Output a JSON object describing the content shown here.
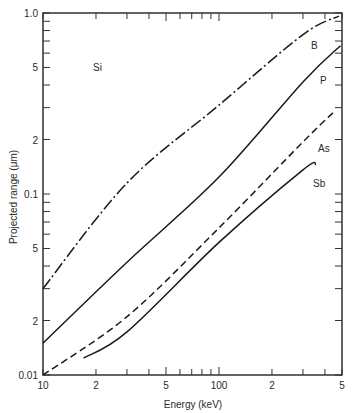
{
  "chart_data": {
    "type": "line",
    "title": "",
    "xlabel": "Energy (keV)",
    "ylabel": "Projected range (μm)",
    "xscale": "log",
    "yscale": "log",
    "xlim": [
      10,
      500
    ],
    "ylim": [
      0.01,
      1.0
    ],
    "grid": false,
    "legend": "inline labels",
    "x_tick_labels": [
      {
        "value": 10,
        "label": "10"
      },
      {
        "value": 20,
        "label": "2"
      },
      {
        "value": 50,
        "label": "5"
      },
      {
        "value": 100,
        "label": "100"
      },
      {
        "value": 200,
        "label": "2"
      },
      {
        "value": 500,
        "label": "5"
      }
    ],
    "y_tick_labels": [
      {
        "value": 0.01,
        "label": "0.01"
      },
      {
        "value": 0.02,
        "label": "2"
      },
      {
        "value": 0.05,
        "label": "5"
      },
      {
        "value": 0.1,
        "label": "0.1"
      },
      {
        "value": 0.2,
        "label": "2"
      },
      {
        "value": 0.5,
        "label": "5"
      },
      {
        "value": 1.0,
        "label": "1.0"
      }
    ],
    "annotations": [
      {
        "text": "Si",
        "x": 25,
        "y": 0.5
      }
    ],
    "series": [
      {
        "name": "B",
        "style": "dash-dot",
        "x": [
          10,
          30,
          100,
          300,
          480
        ],
        "y": [
          0.03,
          0.115,
          0.31,
          0.76,
          0.96
        ]
      },
      {
        "name": "P",
        "style": "solid",
        "x": [
          10,
          30,
          100,
          300,
          490
        ],
        "y": [
          0.015,
          0.042,
          0.124,
          0.416,
          0.66
        ]
      },
      {
        "name": "As",
        "style": "dashed",
        "x": [
          10,
          30,
          100,
          300,
          450
        ],
        "y": [
          0.01,
          0.021,
          0.065,
          0.194,
          0.284
        ]
      },
      {
        "name": "Sb",
        "style": "solid",
        "x": [
          17,
          30,
          100,
          300,
          356
        ],
        "y": [
          0.0124,
          0.0173,
          0.054,
          0.136,
          0.146
        ]
      }
    ],
    "series_labels": [
      {
        "name": "B",
        "px": 311,
        "py": 49
      },
      {
        "name": "P",
        "px": 320,
        "py": 84
      },
      {
        "name": "As",
        "px": 318,
        "py": 152
      },
      {
        "name": "Sb",
        "px": 313,
        "py": 187
      }
    ]
  }
}
